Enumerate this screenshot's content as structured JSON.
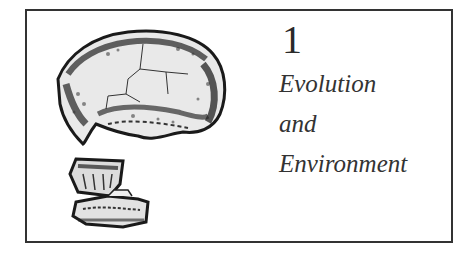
{
  "chapter": {
    "number": "1",
    "title_lines": [
      "Evolution",
      "and",
      "Environment"
    ]
  },
  "illustration": {
    "subject": "fossil-hominid-skull-drawing"
  },
  "colors": {
    "border": "#333333",
    "text": "#333333",
    "background": "#ffffff"
  }
}
